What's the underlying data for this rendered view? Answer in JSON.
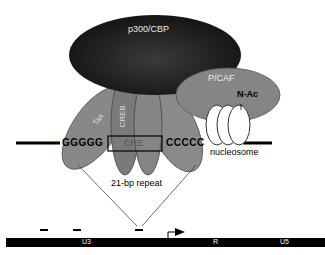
{
  "proteins": {
    "p300": "p300/CBP",
    "pcaf": "P/CAF",
    "tax": "Tax",
    "creb": "CREB"
  },
  "dna": {
    "left_seq": "GGGGG",
    "cre": "CRE",
    "right_seq": "CCCCC",
    "nucleosome": "nucleosome",
    "acetyl": "N-Ac"
  },
  "repeat_label": "21-bp repeat",
  "ltr": {
    "u3": "U3",
    "r": "R",
    "u5": "U5"
  },
  "colors": {
    "p300": "#1c1c1c",
    "protein_gray": "#808080",
    "text_light": "#e6e6e6"
  }
}
